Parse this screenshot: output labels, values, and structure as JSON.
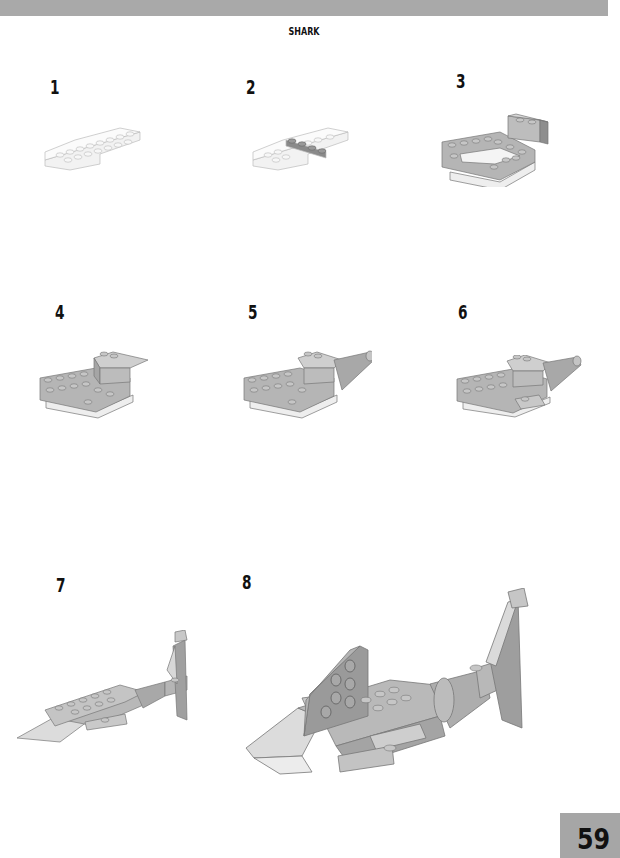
{
  "header": {
    "band_color": "#a9a9a9",
    "title": "SHARK"
  },
  "steps": [
    {
      "number": "1",
      "figure": "white-plates-base"
    },
    {
      "number": "2",
      "figure": "white-plates-with-gray-row"
    },
    {
      "number": "3",
      "figure": "gray-plates-with-bricks"
    },
    {
      "number": "4",
      "figure": "body-with-slope"
    },
    {
      "number": "5",
      "figure": "body-with-cone-tail"
    },
    {
      "number": "6",
      "figure": "body-with-cone-tail-fins"
    },
    {
      "number": "7",
      "figure": "shark-with-tail-fin"
    },
    {
      "number": "8",
      "figure": "complete-shark-with-dorsal-fin"
    }
  ],
  "footer": {
    "page_number": "59",
    "box_color": "#a6a6a6"
  }
}
